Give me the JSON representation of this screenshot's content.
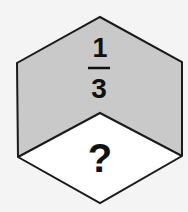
{
  "diagram": {
    "shape": "cube",
    "faces": {
      "left": {
        "fill": "#c9c9c9"
      },
      "right": {
        "fill": "#c9c9c9"
      },
      "top_shaded_label": {
        "numerator": "1",
        "denominator": "3"
      },
      "bottom": {
        "fill": "#ffffff",
        "label": "?"
      }
    },
    "colors": {
      "stroke": "#1a1a1a",
      "background": "#f4f4f4"
    }
  }
}
